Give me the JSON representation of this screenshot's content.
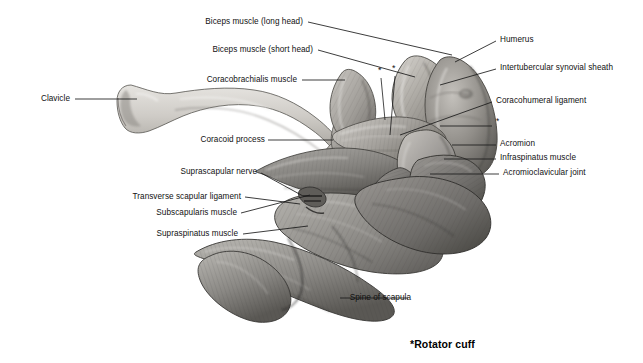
{
  "figure": {
    "caption": "*Rotator cuff",
    "palette": {
      "ink": "#111111",
      "leader_line": "#1a1a1a",
      "bone_light": "#d8d6d2",
      "bone_mid": "#b3b0aa",
      "bone_shadow": "#83807b",
      "muscle_light": "#b6b4b0",
      "muscle_mid": "#8e8c89",
      "muscle_dark": "#5e5c5a",
      "muscle_deep": "#3d3c3b",
      "background": "#ffffff"
    },
    "labels_left": [
      {
        "id": "biceps-long-head",
        "text": "Biceps muscle (long head)",
        "x": 303,
        "y": 22,
        "line": [
          [
            308,
            22
          ],
          [
            452,
            55
          ]
        ]
      },
      {
        "id": "biceps-short-head",
        "text": "Biceps muscle (short head)",
        "x": 313,
        "y": 50,
        "line": [
          [
            318,
            50
          ],
          [
            415,
            77
          ]
        ]
      },
      {
        "id": "coracobrachialis",
        "text": "Coracobrachialis muscle",
        "x": 297,
        "y": 80,
        "line": [
          [
            302,
            80
          ],
          [
            345,
            80
          ]
        ]
      },
      {
        "id": "clavicle",
        "text": "Clavicle",
        "x": 70,
        "y": 99,
        "line": [
          [
            75,
            99
          ],
          [
            137,
            99
          ]
        ]
      },
      {
        "id": "coracoid-process",
        "text": "Coracoid process",
        "x": 265,
        "y": 140,
        "line": [
          [
            268,
            140
          ],
          [
            333,
            140
          ]
        ]
      },
      {
        "id": "suprascapular-nerve",
        "text": "Suprascapular nerve",
        "x": 257,
        "y": 172,
        "line": [
          [
            261,
            173
          ],
          [
            303,
            196
          ]
        ]
      },
      {
        "id": "transverse-scapular-ligament",
        "text": "Transverse scapular ligament",
        "x": 241,
        "y": 197,
        "line": [
          [
            245,
            197
          ],
          [
            300,
            204
          ]
        ]
      },
      {
        "id": "subscapularis",
        "text": "Subscapularis muscle",
        "x": 237,
        "y": 213,
        "line": [
          [
            241,
            213
          ],
          [
            310,
            195
          ]
        ]
      },
      {
        "id": "supraspinatus",
        "text": "Supraspinatus muscle",
        "x": 238,
        "y": 234,
        "line": [
          [
            243,
            234
          ],
          [
            308,
            226
          ]
        ]
      },
      {
        "id": "spine-of-scapula",
        "text": "Spine of scapula",
        "x": 411,
        "y": 298,
        "line": [
          [
            408,
            298
          ],
          [
            340,
            298
          ]
        ]
      }
    ],
    "labels_right": [
      {
        "id": "humerus",
        "text": "Humerus",
        "x": 500,
        "y": 40,
        "line": [
          [
            496,
            41
          ],
          [
            455,
            62
          ]
        ]
      },
      {
        "id": "intertubercular-synovial-sheath",
        "text": "Intertubercular synovial sheath",
        "x": 500,
        "y": 68,
        "line": [
          [
            496,
            69
          ],
          [
            440,
            85
          ]
        ]
      },
      {
        "id": "coracohumeral-ligament",
        "text": "Coracohumeral ligament",
        "x": 496,
        "y": 101,
        "line": [
          [
            492,
            102
          ],
          [
            400,
            135
          ]
        ]
      },
      {
        "id": "rotator-cuff-asterisk-right",
        "text": "*",
        "x": 496,
        "y": 122,
        "line": [
          [
            492,
            126
          ],
          [
            440,
            126
          ]
        ]
      },
      {
        "id": "acromion",
        "text": "Acromion",
        "x": 500,
        "y": 144,
        "line": [
          [
            496,
            145
          ],
          [
            452,
            145
          ]
        ]
      },
      {
        "id": "infraspinatus",
        "text": "Infraspinatus muscle",
        "x": 500,
        "y": 158,
        "line": [
          [
            496,
            159
          ],
          [
            444,
            159
          ]
        ]
      },
      {
        "id": "acromioclavicular-joint",
        "text": "Acromioclavicular joint",
        "x": 503,
        "y": 173,
        "line": [
          [
            499,
            174
          ],
          [
            430,
            174
          ]
        ]
      }
    ],
    "asterisks_on_figure": [
      {
        "id": "asterisk-supraspinatus",
        "text": "*",
        "x": 378,
        "y": 70,
        "line": [
          [
            381,
            78
          ],
          [
            385,
            120
          ]
        ]
      },
      {
        "id": "asterisk-subscapularis",
        "text": "*",
        "x": 392,
        "y": 68,
        "line": [
          [
            395,
            76
          ],
          [
            390,
            135
          ]
        ]
      }
    ]
  }
}
